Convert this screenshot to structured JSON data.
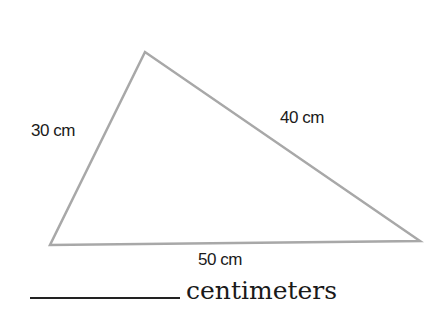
{
  "figure": {
    "shape": "triangle",
    "stroke_color": "#a8a8a8",
    "vertices": {
      "top": [
        145,
        52
      ],
      "bottom_left": [
        50,
        245
      ],
      "bottom_right": [
        420,
        241
      ]
    },
    "sides": {
      "left": "30 cm",
      "right": "40 cm",
      "bottom": "50 cm"
    }
  },
  "answer": {
    "unit": "centimeters"
  }
}
